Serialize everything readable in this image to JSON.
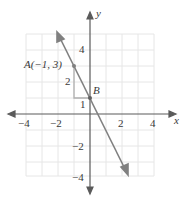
{
  "graph": {
    "x_axis_label": "x",
    "y_axis_label": "y",
    "x_ticks": [
      {
        "value": -4,
        "label": "−4"
      },
      {
        "value": -2,
        "label": "−2"
      },
      {
        "value": 2,
        "label": "2"
      },
      {
        "value": 4,
        "label": "4"
      }
    ],
    "y_ticks": [
      {
        "value": 4,
        "label": "4"
      },
      {
        "value": 1,
        "label": "1"
      },
      {
        "value": -2,
        "label": "−2"
      },
      {
        "value": -4,
        "label": "−4"
      }
    ],
    "point_a_label": "A(−1, 3)",
    "point_b_label": "B",
    "rise_label": "2",
    "run_label": "1",
    "line_color": "#808080",
    "grid_color": "#e6e6e6",
    "triangle_color": "#b0b0b0"
  }
}
